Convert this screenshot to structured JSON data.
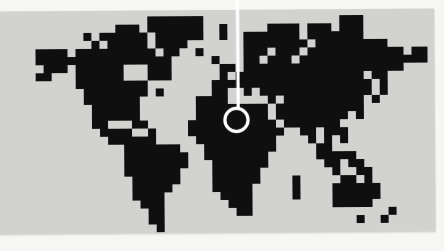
{
  "scene": {
    "description": "Photograph of a light gray card printed with a black pixel-art world map; a thin white plumb line drops from the top edge and ends in a white ring marker over North Africa",
    "colors": {
      "page_background": "#f6f6f3",
      "card_background": "#d2d2d0",
      "land_pixels": "#0f0f0f",
      "marker": "#ffffff"
    }
  },
  "map": {
    "style": "8-bit-pixel-world-map",
    "grid": {
      "cols": 51,
      "rows": 27,
      "cell_size_px": 8
    },
    "land_row_segments": [
      [
        [
          15,
          21
        ],
        [
          39,
          41
        ]
      ],
      [
        [
          11,
          13
        ],
        [
          15,
          21
        ],
        [
          24,
          24
        ],
        [
          30,
          33
        ],
        [
          35,
          37
        ],
        [
          39,
          41
        ]
      ],
      [
        [
          7,
          7
        ],
        [
          9,
          14
        ],
        [
          16,
          21
        ],
        [
          24,
          24
        ],
        [
          27,
          33
        ],
        [
          35,
          41
        ]
      ],
      [
        [
          8,
          8
        ],
        [
          10,
          14
        ],
        [
          16,
          19
        ],
        [
          27,
          34
        ],
        [
          36,
          44
        ]
      ],
      [
        [
          1,
          4
        ],
        [
          6,
          15
        ],
        [
          17,
          18
        ],
        [
          21,
          21
        ],
        [
          27,
          29
        ],
        [
          31,
          33
        ],
        [
          35,
          46
        ],
        [
          48,
          49
        ]
      ],
      [
        [
          1,
          17
        ],
        [
          23,
          23
        ],
        [
          27,
          28
        ],
        [
          30,
          32
        ],
        [
          34,
          49
        ]
      ],
      [
        [
          2,
          4
        ],
        [
          6,
          11
        ],
        [
          15,
          17
        ],
        [
          24,
          25
        ],
        [
          27,
          46
        ]
      ],
      [
        [
          1,
          2
        ],
        [
          6,
          11
        ],
        [
          15,
          17
        ],
        [
          24,
          24
        ],
        [
          26,
          41
        ],
        [
          43,
          44
        ]
      ],
      [
        [
          6,
          14
        ],
        [
          23,
          42
        ],
        [
          44,
          44
        ]
      ],
      [
        [
          7,
          14
        ],
        [
          16,
          16
        ],
        [
          23,
          24
        ],
        [
          27,
          27
        ],
        [
          29,
          31
        ],
        [
          32,
          42
        ],
        [
          44,
          44
        ]
      ],
      [
        [
          7,
          13
        ],
        [
          21,
          24
        ],
        [
          30,
          30
        ],
        [
          32,
          41
        ],
        [
          43,
          43
        ]
      ],
      [
        [
          8,
          13
        ],
        [
          21,
          29
        ],
        [
          31,
          33
        ],
        [
          34,
          37
        ],
        [
          38,
          41
        ]
      ],
      [
        [
          8,
          13
        ],
        [
          21,
          29
        ],
        [
          31,
          33
        ],
        [
          34,
          37
        ],
        [
          38,
          39
        ],
        [
          41,
          41
        ]
      ],
      [
        [
          8,
          9
        ],
        [
          13,
          14
        ],
        [
          20,
          30
        ],
        [
          32,
          33
        ],
        [
          34,
          36
        ],
        [
          37,
          38
        ]
      ],
      [
        [
          9,
          12
        ],
        [
          15,
          15
        ],
        [
          20,
          31
        ],
        [
          34,
          35
        ],
        [
          37,
          38
        ],
        [
          39,
          39
        ]
      ],
      [
        [
          10,
          15
        ],
        [
          21,
          30
        ],
        [
          35,
          35
        ],
        [
          37,
          37
        ],
        [
          39,
          39
        ]
      ],
      [
        [
          12,
          18
        ],
        [
          22,
          30
        ],
        [
          36,
          37
        ]
      ],
      [
        [
          12,
          19
        ],
        [
          22,
          29
        ],
        [
          36,
          37
        ],
        [
          38,
          39
        ],
        [
          40,
          40
        ]
      ],
      [
        [
          12,
          19
        ],
        [
          23,
          29
        ],
        [
          37,
          38
        ],
        [
          40,
          41
        ]
      ],
      [
        [
          12,
          18
        ],
        [
          23,
          28
        ],
        [
          38,
          38
        ],
        [
          41,
          42
        ]
      ],
      [
        [
          13,
          18
        ],
        [
          23,
          28
        ],
        [
          33,
          33
        ],
        [
          39,
          40
        ],
        [
          42,
          42
        ]
      ],
      [
        [
          13,
          17
        ],
        [
          23,
          27
        ],
        [
          33,
          33
        ],
        [
          38,
          43
        ]
      ],
      [
        [
          13,
          16
        ],
        [
          24,
          27
        ],
        [
          33,
          33
        ],
        [
          38,
          43
        ]
      ],
      [
        [
          14,
          16
        ],
        [
          25,
          27
        ],
        [
          38,
          42
        ]
      ],
      [
        [
          15,
          16
        ],
        [
          26,
          27
        ],
        [
          45,
          45
        ]
      ],
      [
        [
          15,
          16
        ],
        [
          41,
          41
        ],
        [
          44,
          44
        ]
      ],
      [
        [
          16,
          16
        ]
      ]
    ]
  },
  "marker": {
    "points_at_region": "north-africa",
    "line": {
      "x_px": 238.3,
      "y_top_px": -2,
      "y_bottom_px": 109,
      "width_px": 3.2
    },
    "ring": {
      "cx_px": 236.5,
      "cy_px": 120,
      "radius_px": 11.6,
      "stroke_px": 3.2
    }
  }
}
